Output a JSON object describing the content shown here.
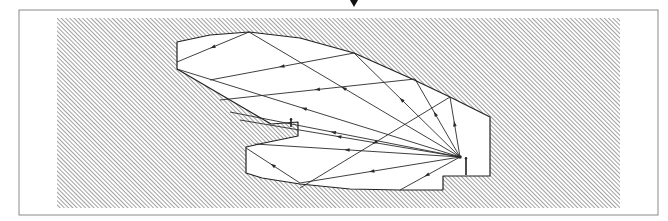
{
  "diagram": {
    "type": "acoustic-reflection-section",
    "colors": {
      "background": "#ffffff",
      "frame": "#8a8a8a",
      "hatch_line": "#6e6e6e",
      "outline": "#222222",
      "ray": "#2a2a2a"
    },
    "frame": {
      "x": 19,
      "y": 10,
      "width": 639,
      "height": 205
    },
    "hatch_area": {
      "x": 57,
      "y": 18,
      "width": 563,
      "height": 190
    },
    "top_marker": {
      "x": 354,
      "y": 7,
      "shape": "down-triangle"
    },
    "room_outline": [
      [
        177,
        42
      ],
      [
        210,
        35
      ],
      [
        249,
        32
      ],
      [
        300,
        38
      ],
      [
        354,
        53
      ],
      [
        410,
        78
      ],
      [
        450,
        97
      ],
      [
        490,
        117
      ],
      [
        490,
        176
      ],
      [
        466,
        176
      ],
      [
        443,
        176
      ],
      [
        443,
        190
      ],
      [
        400,
        190
      ],
      [
        350,
        189
      ],
      [
        300,
        184
      ],
      [
        262,
        178
      ],
      [
        246,
        173
      ],
      [
        246,
        147
      ],
      [
        264,
        143
      ],
      [
        298,
        136
      ],
      [
        298,
        122
      ],
      [
        271,
        124
      ],
      [
        177,
        69
      ]
    ],
    "source": {
      "x": 460,
      "y": 157,
      "label": "sound-source"
    },
    "stage_figure": {
      "x": 466,
      "y": 157,
      "height": 18
    },
    "balcony_figure": {
      "x": 291,
      "y": 118,
      "height": 9
    },
    "rays": [
      {
        "from": [
          460,
          157
        ],
        "to": [
          249,
          32
        ],
        "then": [
          177,
          62
        ]
      },
      {
        "from": [
          460,
          157
        ],
        "to": [
          354,
          53
        ],
        "then": [
          210,
          80
        ]
      },
      {
        "from": [
          460,
          157
        ],
        "to": [
          415,
          79
        ],
        "then": [
          220,
          100
        ]
      },
      {
        "from": [
          460,
          157
        ],
        "to": [
          450,
          97
        ],
        "then": [
          300,
          188
        ]
      },
      {
        "from": [
          460,
          157
        ],
        "to": [
          177,
          69
        ]
      },
      {
        "from": [
          460,
          157
        ],
        "to": [
          230,
          112
        ]
      },
      {
        "from": [
          460,
          157
        ],
        "to": [
          240,
          120
        ]
      },
      {
        "from": [
          460,
          157
        ],
        "to": [
          255,
          144
        ]
      },
      {
        "from": [
          460,
          157
        ],
        "to": [
          300,
          183
        ],
        "then": [
          246,
          148
        ]
      },
      {
        "from": [
          460,
          157
        ],
        "to": [
          400,
          190
        ]
      }
    ]
  }
}
